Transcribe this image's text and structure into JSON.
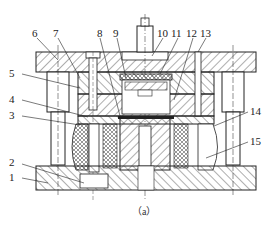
{
  "figure": {
    "caption": "（a）",
    "type": "mold-die-cross-section",
    "labels": [
      {
        "id": "1",
        "text": "1",
        "x": 16,
        "y": 175
      },
      {
        "id": "2",
        "text": "2",
        "x": 16,
        "y": 160
      },
      {
        "id": "3",
        "text": "3",
        "x": 16,
        "y": 112
      },
      {
        "id": "4",
        "text": "4",
        "x": 16,
        "y": 96
      },
      {
        "id": "5",
        "text": "5",
        "x": 16,
        "y": 70
      },
      {
        "id": "6",
        "text": "6",
        "x": 32,
        "y": 28
      },
      {
        "id": "7",
        "text": "7",
        "x": 53,
        "y": 28
      },
      {
        "id": "8",
        "text": "8",
        "x": 97,
        "y": 28
      },
      {
        "id": "9",
        "text": "9",
        "x": 113,
        "y": 28
      },
      {
        "id": "10",
        "text": "10",
        "x": 158,
        "y": 28
      },
      {
        "id": "11",
        "text": "11",
        "x": 173,
        "y": 28
      },
      {
        "id": "12",
        "text": "12",
        "x": 188,
        "y": 28
      },
      {
        "id": "13",
        "text": "13",
        "x": 201,
        "y": 28
      },
      {
        "id": "14",
        "text": "14",
        "x": 249,
        "y": 108
      },
      {
        "id": "15",
        "text": "15",
        "x": 249,
        "y": 138
      }
    ]
  },
  "colors": {
    "line": "#222222",
    "hatch": "#333333",
    "background": "#ffffff"
  }
}
